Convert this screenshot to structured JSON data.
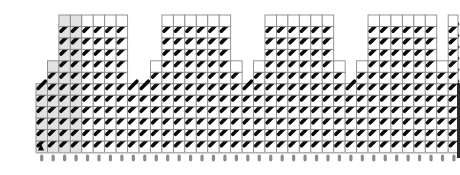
{
  "diagram": {
    "type": "stitch-chart-grid",
    "cell_size": 11.45,
    "origin_x": 36,
    "origin_y": 15,
    "columns": 37,
    "rows": 12,
    "shaded_columns": [
      0,
      1,
      2,
      3
    ],
    "colors": {
      "grid_line": "#8a8a8a",
      "shaded_fill": "#e2e2e2",
      "cell_fill": "#ffffff",
      "stitch": "#0a0a0a",
      "pin": "#8c8c8c",
      "edge_bar": "#2a2a2a"
    },
    "column_heights": [
      6,
      8,
      12,
      12,
      12,
      12,
      12,
      12,
      6,
      6,
      8,
      12,
      12,
      12,
      12,
      12,
      12,
      8,
      6,
      8,
      12,
      12,
      12,
      12,
      12,
      12,
      8,
      6,
      8,
      12,
      12,
      12,
      12,
      12,
      12,
      8,
      12
    ],
    "towers": [
      {
        "name": "tower-1",
        "top_cols": [
          2,
          7
        ],
        "step_cols": [
          1,
          7
        ]
      },
      {
        "name": "tower-2",
        "top_cols": [
          10,
          15
        ],
        "step_cols": [
          9,
          16
        ]
      },
      {
        "name": "tower-3",
        "top_cols": [
          18,
          23
        ],
        "step_cols": [
          17,
          24
        ]
      },
      {
        "name": "tower-4",
        "top_cols": [
          26,
          31
        ],
        "step_cols": [
          25,
          32
        ]
      },
      {
        "name": "tower-5",
        "top_cols": [
          34,
          36
        ],
        "step_cols": [
          33,
          36
        ]
      }
    ],
    "stitch_icon": "diagonal-stitch-mark",
    "start_marker_icon": "triangle-start-marker",
    "pin_icon": "needle-pin"
  }
}
